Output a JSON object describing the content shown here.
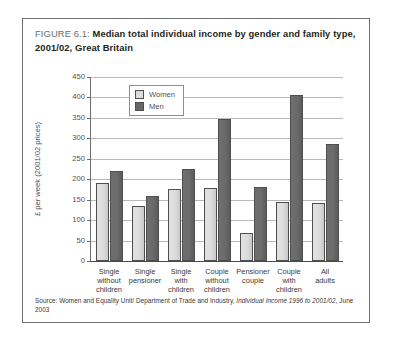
{
  "figure": {
    "number_label": "FIGURE 6.1:",
    "title": "Median total individual income by gender and family type, 2001/02, Great Britain",
    "source": "Source: Women and Equality Unit/ Department of Trade and Industry,",
    "source_italic": "Individual Income 1996 to 2001/02,",
    "source_tail": "June 2003"
  },
  "legend": {
    "position": "top-left-inside-plot",
    "entries": [
      {
        "label": "Women",
        "color": "#dcdcdc"
      },
      {
        "label": "Men",
        "color": "#676767"
      }
    ]
  },
  "chart_data": {
    "type": "bar",
    "title": "Median total individual income by gender and family type, 2001/02, Great Britain",
    "xlabel": "",
    "ylabel": "£ per week (2001/02 prices)",
    "ylim": [
      0,
      450
    ],
    "ytick_step": 50,
    "yticks": [
      0,
      50,
      100,
      150,
      200,
      250,
      300,
      350,
      400,
      450
    ],
    "grid": true,
    "grid_axis": "y",
    "legend_position": "upper left",
    "categories": [
      "Single without children",
      "Single pensioner",
      "Single with children",
      "Couple without children",
      "Pensioner couple",
      "Couple with children",
      "All adults"
    ],
    "category_lines": [
      [
        "Single",
        "without",
        "children"
      ],
      [
        "Single",
        "pensioner",
        ""
      ],
      [
        "Single",
        "with",
        "children"
      ],
      [
        "Couple",
        "without",
        "children"
      ],
      [
        "Pensioner",
        "couple",
        ""
      ],
      [
        "Couple",
        "with",
        "children"
      ],
      [
        "All",
        "adults",
        ""
      ]
    ],
    "series": [
      {
        "name": "Women",
        "color": "#dcdcdc",
        "values": [
          190,
          135,
          175,
          178,
          68,
          145,
          143
        ]
      },
      {
        "name": "Men",
        "color": "#676767",
        "values": [
          220,
          160,
          225,
          348,
          182,
          405,
          285
        ]
      }
    ]
  }
}
